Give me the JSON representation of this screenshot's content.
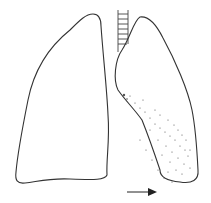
{
  "diagram": {
    "colors": {
      "background": "#ffffff",
      "outline": "#333333",
      "stipple": "#555555",
      "arrow": "#222222"
    },
    "elements": [
      {
        "id": "left-lung",
        "label": "Left outline (viewer's left) lung"
      },
      {
        "id": "right-lung",
        "label": "Right outline (viewer's right) lung with stippled lower-medial shading"
      },
      {
        "id": "trachea",
        "label": "Trachea with cartilage rings"
      },
      {
        "id": "arrow",
        "label": "Arrow pointing right",
        "direction": "right"
      }
    ]
  }
}
